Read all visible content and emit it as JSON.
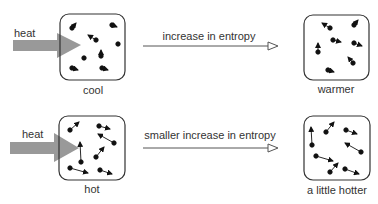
{
  "rows": [
    {
      "heat_label": "heat",
      "initial_label": "cool",
      "process_label": "increase in entropy",
      "final_label": "warmer"
    },
    {
      "heat_label": "heat",
      "initial_label": "hot",
      "process_label": "smaller increase in entropy",
      "final_label": "a little hotter"
    }
  ],
  "colors": {
    "heat_arrow": "#999999",
    "box_stroke": "#333333",
    "particle": "#111111",
    "arrow_line": "#555555"
  }
}
